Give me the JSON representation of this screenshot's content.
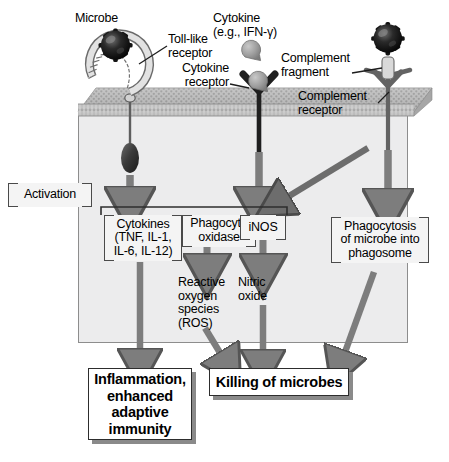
{
  "figure": {
    "colors": {
      "cell_fill": "#ececed",
      "membrane": "#9a9a9a",
      "arrow_gray": "#7d7d7d",
      "arrow_dark": "#6d6d6d",
      "microbe": "#1c1c1c",
      "receptor_dark": "#232323",
      "cytokine_blob": "#9b9b9b",
      "box_fill": "#f4f4f4",
      "text": "#000000"
    }
  },
  "labels": {
    "microbe": "Microbe",
    "toll_like_receptor": "Toll-like\nreceptor",
    "cytokine": "Cytokine\n(e.g., IFN-γ)",
    "cytokine_receptor": "Cytokine\nreceptor",
    "complement_fragment": "Complement\nfragment",
    "complement_receptor": "Complement\nreceptor",
    "activation": "Activation"
  },
  "effector_boxes": [
    {
      "id": "cytokines",
      "text": "Cytokines\n(TNF, IL-1,\nIL-6, IL-12)"
    },
    {
      "id": "phagocyte-oxidase",
      "text": "Phagocyte\noxidase"
    },
    {
      "id": "inos",
      "text": "iNOS"
    },
    {
      "id": "phagocytosis",
      "text": "Phagocytosis\nof microbe into\nphagosome"
    }
  ],
  "intermediates": [
    {
      "id": "ros",
      "text": "Reactive\noxygen\nspecies\n(ROS)"
    },
    {
      "id": "nitric-oxide",
      "text": "Nitric\noxide"
    }
  ],
  "outcomes": [
    {
      "id": "inflammation",
      "text": "Inflammation,\nenhanced\nadaptive\nimmunity"
    },
    {
      "id": "killing",
      "text": "Killing of microbes"
    }
  ],
  "icons": {
    "microbe_left": "microbe-icon",
    "microbe_right": "microbe-icon",
    "toll_like_receptor": "toll-like-receptor-icon",
    "cytokine_blob": "cytokine-molecule-icon",
    "cytokine_receptor": "cytokine-receptor-icon",
    "complement_receptor": "complement-receptor-icon",
    "signaling_ellipse": "signaling-molecule-icon",
    "membrane": "plasma-membrane-icon"
  }
}
